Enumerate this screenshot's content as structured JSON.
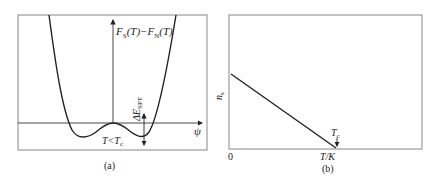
{
  "panel_a": {
    "caption": "(a)",
    "y_axis_label_main": "F",
    "y_axis_label_sub1": "S",
    "y_axis_label_mid": "(T)−F",
    "y_axis_label_sub2": "N",
    "y_axis_label_end": "(T)",
    "x_axis_label": "ψ",
    "condition_label_main": "T<T",
    "condition_label_sub": "c",
    "energy_label_main": "ΔE",
    "energy_label_sub": "SPT"
  },
  "panel_b": {
    "caption": "(b)",
    "y_axis_label_main": "n",
    "y_axis_label_sub": "s",
    "origin_label": "0",
    "x_axis_label": "T/K",
    "tc_label_main": "T",
    "tc_label_sub": "c"
  },
  "colors": {
    "line": "#222222",
    "frame": "#888888"
  }
}
